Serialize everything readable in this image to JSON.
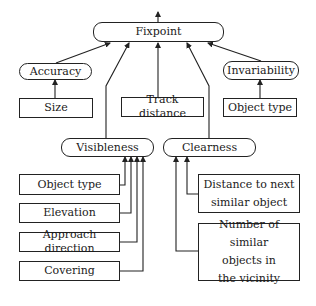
{
  "diagram": {
    "root": {
      "id": "fixpoint",
      "label": "Fixpoint"
    },
    "criteria": [
      {
        "id": "accuracy",
        "label": "Accuracy",
        "children": [
          {
            "id": "size",
            "label": "Size"
          }
        ]
      },
      {
        "id": "track-distance",
        "label": "Track distance",
        "children": []
      },
      {
        "id": "invariability",
        "label": "Invariability",
        "children": [
          {
            "id": "object-type-right",
            "label": "Object type"
          }
        ]
      },
      {
        "id": "visibleness",
        "label": "Visibleness",
        "children": [
          {
            "id": "object-type-left",
            "label": "Object type"
          },
          {
            "id": "elevation",
            "label": "Elevation"
          },
          {
            "id": "approach-direction",
            "label": "Approach direction"
          },
          {
            "id": "covering",
            "label": "Covering"
          }
        ]
      },
      {
        "id": "clearness",
        "label": "Clearness",
        "children": [
          {
            "id": "distance-next",
            "label": "Distance to next\nsimilar object"
          },
          {
            "id": "number-similar",
            "label": "Number of similar\nobjects in\nthe vicinity"
          }
        ]
      }
    ],
    "colors": {
      "line": "#222222",
      "background": "#ffffff"
    }
  },
  "labels": {
    "fixpoint": "Fixpoint",
    "accuracy": "Accuracy",
    "invariability": "Invariability",
    "size": "Size",
    "track_distance": "Track distance",
    "object_type_right": "Object type",
    "visibleness": "Visibleness",
    "clearness": "Clearness",
    "object_type_left": "Object type",
    "elevation": "Elevation",
    "approach_direction": "Approach direction",
    "covering": "Covering",
    "distance_next": "Distance to next\nsimilar object",
    "number_similar": "Number of similar\nobjects in\nthe vicinity"
  }
}
